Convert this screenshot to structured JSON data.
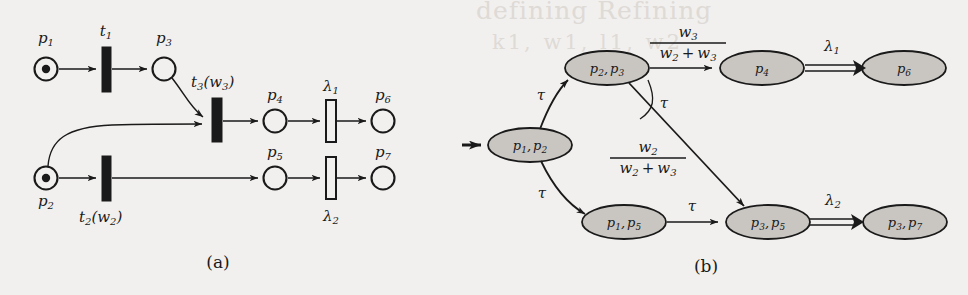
{
  "figure": {
    "caption_a": "(a)",
    "caption_b": "(b)",
    "background_color": "#f2f0ee",
    "ink_color": "#1a1a1a",
    "node_fill_color": "#c9c6c2"
  },
  "bleed_through_text": {
    "line1": "defining  Refining",
    "line2": "k1, w1, l1, w2"
  },
  "panel_a": {
    "title": "(a)",
    "places": [
      {
        "id": "p1",
        "label": "p",
        "sub": "1",
        "tokens": 1
      },
      {
        "id": "p2",
        "label": "p",
        "sub": "2",
        "tokens": 1
      },
      {
        "id": "p3",
        "label": "p",
        "sub": "3",
        "tokens": 0
      },
      {
        "id": "p4",
        "label": "p",
        "sub": "4",
        "tokens": 0
      },
      {
        "id": "p5",
        "label": "p",
        "sub": "5",
        "tokens": 0
      },
      {
        "id": "p6",
        "label": "p",
        "sub": "6",
        "tokens": 0
      },
      {
        "id": "p7",
        "label": "p",
        "sub": "7",
        "tokens": 0
      }
    ],
    "transitions": [
      {
        "id": "t1",
        "label": "t",
        "sub": "1",
        "arg": "",
        "style": "immediate"
      },
      {
        "id": "t2",
        "label": "t",
        "sub": "2",
        "arg": "(w2)",
        "style": "immediate"
      },
      {
        "id": "t3",
        "label": "t",
        "sub": "3",
        "arg": "(w3)",
        "style": "immediate"
      },
      {
        "id": "l1",
        "label": "λ",
        "sub": "1",
        "arg": "",
        "style": "timed"
      },
      {
        "id": "l2",
        "label": "λ",
        "sub": "2",
        "arg": "",
        "style": "timed"
      }
    ],
    "labels": {
      "t1": "t",
      "t1_sub": "1",
      "t2": "t",
      "t2_sub": "2",
      "t2_arg_open": "(w",
      "t2_arg_sub": "2",
      "t2_arg_close": ")",
      "t3": "t",
      "t3_sub": "3",
      "t3_arg_open": "(w",
      "t3_arg_sub": "3",
      "t3_arg_close": ")",
      "lambda1": "λ",
      "lambda1_sub": "1",
      "lambda2": "λ",
      "lambda2_sub": "2",
      "p1": "p",
      "p1_sub": "1",
      "p2": "p",
      "p2_sub": "2",
      "p3": "p",
      "p3_sub": "3",
      "p4": "p",
      "p4_sub": "4",
      "p5": "p",
      "p5_sub": "5",
      "p6": "p",
      "p6_sub": "6",
      "p7": "p",
      "p7_sub": "7"
    }
  },
  "panel_b": {
    "title": "(b)",
    "states": [
      {
        "id": "s_p1p2",
        "text": "p₁, p₂"
      },
      {
        "id": "s_p2p3",
        "text": "p₂, p₃"
      },
      {
        "id": "s_p4",
        "text": "p₄"
      },
      {
        "id": "s_p6",
        "text": "p₆"
      },
      {
        "id": "s_p1p5",
        "text": "p₁, p₅"
      },
      {
        "id": "s_p3p5",
        "text": "p₃, p₅"
      },
      {
        "id": "s_p3p7",
        "text": "p₃, p₇"
      }
    ],
    "node_labels": {
      "p1p2_a": "p",
      "p1p2_a_sub": "1",
      "p1p2_comma": ",",
      "p1p2_b": "p",
      "p1p2_b_sub": "2",
      "p2p3_a": "p",
      "p2p3_a_sub": "2",
      "p2p3_comma": ",",
      "p2p3_b": "p",
      "p2p3_b_sub": "3",
      "p4": "p",
      "p4_sub": "4",
      "p6": "p",
      "p6_sub": "6",
      "p1p5_a": "p",
      "p1p5_a_sub": "1",
      "p1p5_comma": ",",
      "p1p5_b": "p",
      "p1p5_b_sub": "5",
      "p3p5_a": "p",
      "p3p5_a_sub": "3",
      "p3p5_comma": ",",
      "p3p5_b": "p",
      "p3p5_b_sub": "5",
      "p3p7_a": "p",
      "p3p7_a_sub": "3",
      "p3p7_comma": ",",
      "p3p7_b": "p",
      "p3p7_b_sub": "7"
    },
    "edges": [
      {
        "from": "s_p1p2",
        "to": "s_p2p3",
        "label": "τ",
        "kind": "single"
      },
      {
        "from": "s_p1p2",
        "to": "s_p1p5",
        "label": "τ",
        "kind": "single"
      },
      {
        "from": "s_p2p3",
        "to": "s_p4",
        "label": "w3/(w2+w3)",
        "kind": "single"
      },
      {
        "from": "s_p2p3",
        "to": "s_p3p5",
        "label": "w2/(w2+w3)",
        "kind": "single"
      },
      {
        "from": "s_p1p5",
        "to": "s_p3p5",
        "label": "τ",
        "kind": "single"
      },
      {
        "from": "s_p4",
        "to": "s_p6",
        "label": "λ₁",
        "kind": "double"
      },
      {
        "from": "s_p3p5",
        "to": "s_p3p7",
        "label": "λ₂",
        "kind": "double"
      }
    ],
    "edge_labels": {
      "tau_upper": "τ",
      "tau_lower": "τ",
      "tau_choice": "τ",
      "tau_bottom": "τ",
      "lambda1": "λ",
      "lambda1_sub": "1",
      "lambda2": "λ",
      "lambda2_sub": "2",
      "frac_top_num": "w",
      "frac_top_num_sub": "3",
      "frac_top_den_a": "w",
      "frac_top_den_a_sub": "2",
      "frac_top_den_plus": "+",
      "frac_top_den_b": "w",
      "frac_top_den_b_sub": "3",
      "frac_mid_num": "w",
      "frac_mid_num_sub": "2",
      "frac_mid_den_a": "w",
      "frac_mid_den_a_sub": "2",
      "frac_mid_den_plus": "+",
      "frac_mid_den_b": "w",
      "frac_mid_den_b_sub": "3"
    },
    "initial_marker": "initial-state-arrow"
  }
}
